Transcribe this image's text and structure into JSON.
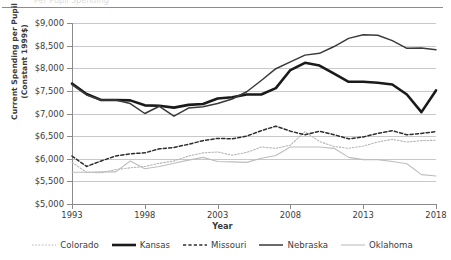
{
  "figure": {
    "ylabel_line1": "Current Spending per Pupil",
    "ylabel_line2": "(Constant 1999$)",
    "xlabel": "Year",
    "cropped_title": "Per Pupil Spending"
  },
  "axes": {
    "y_ticks": [
      "$5,000",
      "$5,500",
      "$6,000",
      "$6,500",
      "$7,000",
      "$7,500",
      "$8,000",
      "$8,500",
      "$9,000"
    ],
    "x_ticks": [
      "1993",
      "1998",
      "2003",
      "2008",
      "2013",
      "2018"
    ]
  },
  "legend": {
    "items": [
      {
        "label": "Colorado",
        "style": "dotted",
        "color": "#b6b6b6",
        "width": 1.1
      },
      {
        "label": "Kansas",
        "style": "solid",
        "color": "#1a1a1a",
        "width": 2.6
      },
      {
        "label": "Missouri",
        "style": "dashed",
        "color": "#2e2e2e",
        "width": 1.5
      },
      {
        "label": "Nebraska",
        "style": "solid",
        "color": "#3a3a3a",
        "width": 1.5
      },
      {
        "label": "Oklahoma",
        "style": "solid-light",
        "color": "#bdbdbd",
        "width": 1.1
      }
    ]
  },
  "chart_data": {
    "type": "line",
    "title": "",
    "xlabel": "Year",
    "ylabel": "Current Spending per Pupil (Constant 1999$)",
    "xlim": [
      1993,
      2018
    ],
    "ylim": [
      5000,
      9000
    ],
    "ytick_step": 500,
    "grid": true,
    "legend_position": "bottom",
    "x": [
      1993,
      1994,
      1995,
      1996,
      1997,
      1998,
      1999,
      2000,
      2001,
      2002,
      2003,
      2004,
      2005,
      2006,
      2007,
      2008,
      2009,
      2010,
      2011,
      2012,
      2013,
      2014,
      2015,
      2016,
      2017,
      2018
    ],
    "series": [
      {
        "name": "Colorado",
        "values": [
          5920,
          5700,
          5690,
          5760,
          5800,
          5830,
          5900,
          5950,
          6060,
          6130,
          6150,
          6080,
          6140,
          6260,
          6230,
          6300,
          6600,
          6380,
          6270,
          6230,
          6280,
          6370,
          6430,
          6370,
          6400,
          6410
        ]
      },
      {
        "name": "Kansas",
        "values": [
          7660,
          7430,
          7300,
          7300,
          7290,
          7180,
          7170,
          7130,
          7190,
          7210,
          7330,
          7360,
          7420,
          7420,
          7560,
          7960,
          8120,
          8060,
          7880,
          7700,
          7700,
          7680,
          7640,
          7420,
          7030,
          7510
        ]
      },
      {
        "name": "Missouri",
        "values": [
          6060,
          5830,
          5950,
          6060,
          6110,
          6130,
          6220,
          6250,
          6320,
          6400,
          6450,
          6440,
          6500,
          6620,
          6720,
          6610,
          6530,
          6610,
          6530,
          6440,
          6480,
          6560,
          6620,
          6530,
          6560,
          6600
        ]
      },
      {
        "name": "Nebraska",
        "values": [
          7640,
          7410,
          7300,
          7300,
          7220,
          7000,
          7160,
          6940,
          7120,
          7150,
          7220,
          7320,
          7480,
          7730,
          7990,
          8140,
          8290,
          8330,
          8480,
          8660,
          8740,
          8730,
          8610,
          8440,
          8450,
          8410
        ]
      },
      {
        "name": "Oklahoma",
        "values": [
          5700,
          5700,
          5710,
          5710,
          5950,
          5780,
          5830,
          5900,
          5970,
          6030,
          5940,
          5930,
          5920,
          6010,
          6070,
          6260,
          6260,
          6260,
          6230,
          6030,
          5980,
          5980,
          5940,
          5890,
          5650,
          5620
        ]
      }
    ]
  }
}
